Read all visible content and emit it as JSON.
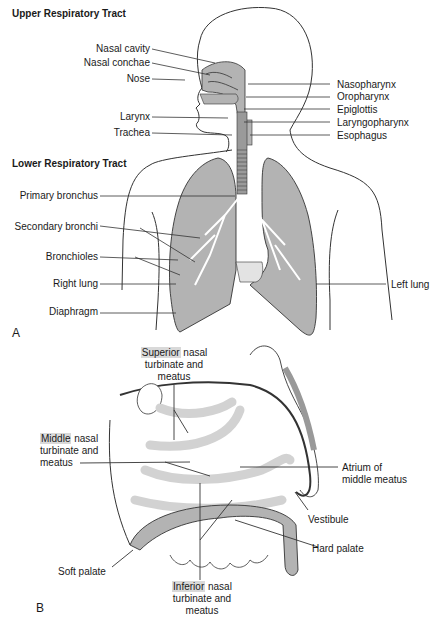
{
  "panel_a": {
    "letter": "A",
    "upper_title": "Upper Respiratory Tract",
    "lower_title": "Lower Respiratory Tract",
    "left_labels": [
      "Nasal cavity",
      "Nasal conchae",
      "Nose",
      "Larynx",
      "Trachea"
    ],
    "right_labels": [
      "Nasopharynx",
      "Oropharynx",
      "Epiglottis",
      "Laryngopharynx",
      "Esophagus"
    ],
    "lower_left_labels": [
      "Primary bronchus",
      "Secondary bronchi",
      "Bronchioles",
      "Right lung",
      "Diaphragm"
    ],
    "lower_right_labels": [
      "Left lung"
    ]
  },
  "panel_b": {
    "letter": "B",
    "superior": {
      "highlight": "Superior",
      "rest": " nasal",
      "line2": "turbinate and",
      "line3": "meatus"
    },
    "middle": {
      "highlight": "Middle",
      "rest": " nasal",
      "line2": "turbinate and",
      "line3": "meatus"
    },
    "inferior": {
      "highlight": "Inferior",
      "rest": " nasal",
      "line2": "turbinate and",
      "line3": "meatus"
    },
    "atrium": {
      "line1": "Atrium of",
      "line2": "middle meatus"
    },
    "vestibule": "Vestibule",
    "hard_palate": "Hard palate",
    "soft_palate": "Soft palate"
  },
  "colors": {
    "tissue": "#b3b3b3",
    "outline": "#333333",
    "highlight": "#d9d9d9"
  }
}
